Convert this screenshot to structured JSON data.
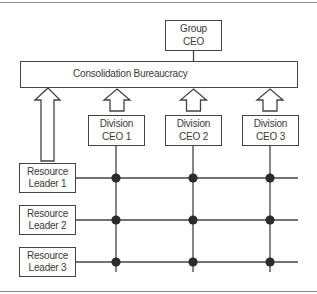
{
  "diagram": {
    "top_node": {
      "label": "Group\nCEO"
    },
    "consolidation": {
      "label": "Consolidation Bureaucracy"
    },
    "divisions": [
      {
        "label": "Division\nCEO 1"
      },
      {
        "label": "Division\nCEO 2"
      },
      {
        "label": "Division\nCEO 3"
      }
    ],
    "resource_leaders": [
      {
        "label": "Resource\nLeader 1"
      },
      {
        "label": "Resource\nLeader 2"
      },
      {
        "label": "Resource\nLeader 3"
      }
    ],
    "colors": {
      "stroke": "#444444",
      "node_dot": "#2b2b2b",
      "frame": "#8a8a8a",
      "text": "#3a3a3a"
    }
  }
}
